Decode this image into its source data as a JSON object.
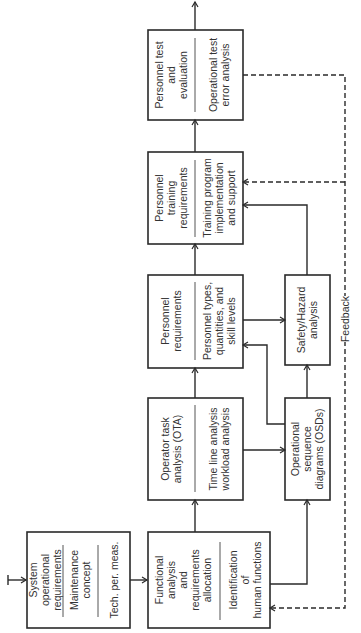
{
  "diagram": {
    "orientation": "rotated-90-ccw",
    "nodes": {
      "system_ops": {
        "top": [
          "System",
          "operational",
          "requirements"
        ],
        "middle": [
          "Maintenance",
          "concept"
        ],
        "bottom": [
          "Tech. per. meas."
        ]
      },
      "functional": {
        "top": [
          "Functional",
          "analysis",
          "and",
          "requirements",
          "allocation"
        ],
        "bottom": [
          "Identification",
          "of",
          "human functions"
        ]
      },
      "ota": {
        "top": [
          "Operator task",
          "analysis (OTA)"
        ],
        "bottom": [
          "Time line analysis",
          "workload analysis"
        ]
      },
      "personnel_req": {
        "top": [
          "Personnel",
          "requirements"
        ],
        "bottom": [
          "Personnel types,",
          "quantities, and",
          "skill levels"
        ]
      },
      "training": {
        "top": [
          "Personnel",
          "training",
          "requirements"
        ],
        "bottom": [
          "Training program",
          "implementation",
          "and support"
        ]
      },
      "test_eval": {
        "top": [
          "Personnel test",
          "and",
          "evaluation"
        ],
        "bottom": [
          "Operational test",
          "error analysis"
        ]
      },
      "osd": {
        "top": [
          "Operational",
          "sequence",
          "diagrams (OSDs)"
        ]
      },
      "safety": {
        "top": [
          "Safety/Hazard",
          "analysis"
        ]
      }
    },
    "feedback_label": "Feedback"
  }
}
